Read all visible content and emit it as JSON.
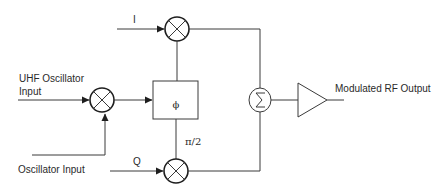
{
  "diagram": {
    "title": "",
    "labels": {
      "i_input": "I",
      "q_input": "Q",
      "uhf_input_line1": "UHF Oscillator",
      "uhf_input_line2": "Input",
      "osc_input": "Oscillator Input",
      "phase_shifter": "ϕ",
      "phase_offset": "π/2",
      "output": "Modulated RF Output"
    },
    "blocks": [
      {
        "id": "mixer-i",
        "type": "multiplier",
        "symbol": "⊗"
      },
      {
        "id": "mixer-uhf",
        "type": "multiplier",
        "symbol": "⊗"
      },
      {
        "id": "mixer-q",
        "type": "multiplier",
        "symbol": "⊗"
      },
      {
        "id": "phase-shifter",
        "type": "box",
        "symbol": "ϕ"
      },
      {
        "id": "summer",
        "type": "summation",
        "symbol": "Σ"
      },
      {
        "id": "amplifier",
        "type": "triangle"
      }
    ],
    "connections": [
      {
        "from": "I",
        "to": "mixer-i"
      },
      {
        "from": "Q",
        "to": "mixer-q"
      },
      {
        "from": "UHF Oscillator Input",
        "to": "mixer-uhf"
      },
      {
        "from": "Oscillator Input",
        "to": "mixer-uhf"
      },
      {
        "from": "mixer-uhf",
        "to": "phase-shifter"
      },
      {
        "from": "phase-shifter",
        "to": "mixer-i"
      },
      {
        "from": "phase-shifter",
        "to": "mixer-q",
        "label": "π/2"
      },
      {
        "from": "mixer-i",
        "to": "summer"
      },
      {
        "from": "mixer-q",
        "to": "summer"
      },
      {
        "from": "summer",
        "to": "amplifier"
      },
      {
        "from": "amplifier",
        "to": "Modulated RF Output"
      }
    ],
    "colors": {
      "line": "#3a3a3a",
      "text": "#2a2a2a",
      "background": "#ffffff"
    }
  }
}
